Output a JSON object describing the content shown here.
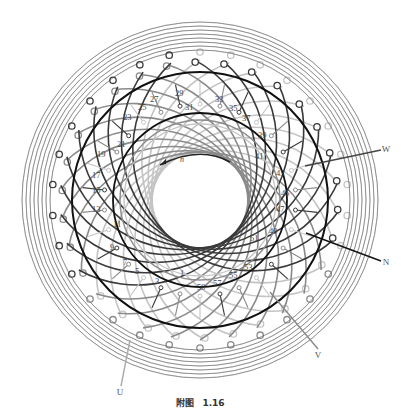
{
  "figure": {
    "caption_prefix": "附图",
    "caption_number": "1.16",
    "rotation_label": "n",
    "center": [
      200,
      200
    ],
    "colors": {
      "phase_dark": "#3a3a3a",
      "phase_mid": "#8a8a8a",
      "phase_light": "#c4c4c4",
      "ring": "#111111"
    },
    "slot_numbers": [
      {
        "n": "1",
        "x": 180,
        "y": 276
      },
      {
        "n": "3",
        "x": 155,
        "y": 284
      },
      {
        "n": "5",
        "x": 135,
        "y": 274
      },
      {
        "n": "7",
        "x": 123,
        "y": 265
      },
      {
        "n": "9",
        "x": 110,
        "y": 250
      },
      {
        "n": "11",
        "x": 113,
        "y": 227
      },
      {
        "n": "13",
        "x": 92,
        "y": 212
      },
      {
        "n": "15",
        "x": 92,
        "y": 193
      },
      {
        "n": "17",
        "x": 92,
        "y": 178
      },
      {
        "n": "19",
        "x": 97,
        "y": 157
      },
      {
        "n": "21",
        "x": 117,
        "y": 147
      },
      {
        "n": "23",
        "x": 123,
        "y": 120
      },
      {
        "n": "25",
        "x": 138,
        "y": 110
      },
      {
        "n": "27",
        "x": 150,
        "y": 102
      },
      {
        "n": "29",
        "x": 175,
        "y": 96
      },
      {
        "n": "31",
        "x": 185,
        "y": 110
      },
      {
        "n": "33",
        "x": 215,
        "y": 102
      },
      {
        "n": "35",
        "x": 229,
        "y": 111
      },
      {
        "n": "37",
        "x": 242,
        "y": 121
      },
      {
        "n": "39",
        "x": 258,
        "y": 138
      },
      {
        "n": "41",
        "x": 255,
        "y": 159
      },
      {
        "n": "43",
        "x": 276,
        "y": 176
      },
      {
        "n": "45",
        "x": 281,
        "y": 196
      },
      {
        "n": "47",
        "x": 276,
        "y": 212
      },
      {
        "n": "49",
        "x": 269,
        "y": 234
      },
      {
        "n": "51",
        "x": 250,
        "y": 241
      },
      {
        "n": "53",
        "x": 244,
        "y": 270
      },
      {
        "n": "55",
        "x": 229,
        "y": 278
      },
      {
        "n": "57",
        "x": 213,
        "y": 286
      },
      {
        "n": "59",
        "x": 197,
        "y": 290
      }
    ],
    "terminals": [
      {
        "label": "W",
        "x": 386,
        "y": 152,
        "lx1": 305,
        "ly1": 166,
        "lx2": 381,
        "ly2": 150,
        "color": "#444444"
      },
      {
        "label": "N",
        "x": 386,
        "y": 265,
        "lx1": 306,
        "ly1": 233,
        "lx2": 381,
        "ly2": 261,
        "color": "#111111"
      },
      {
        "label": "V",
        "x": 318,
        "y": 358,
        "lx1": 270,
        "ly1": 292,
        "lx2": 318,
        "ly2": 349,
        "color": "#888888"
      },
      {
        "label": "U",
        "x": 120,
        "y": 395,
        "lx1": 130,
        "ly1": 340,
        "lx2": 121,
        "ly2": 386,
        "color": "#aaaaaa"
      }
    ]
  }
}
